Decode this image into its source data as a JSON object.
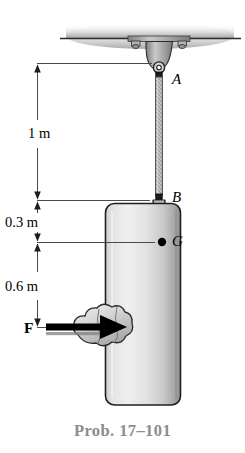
{
  "figure": {
    "caption": "Prob. 17–101",
    "points": {
      "support": "A",
      "attachment": "B",
      "center_of_mass": "G"
    },
    "force": {
      "label": "F",
      "direction": "right",
      "application_point_label": ""
    },
    "dimensions": [
      {
        "label": "1 m",
        "from": "A",
        "to": "B"
      },
      {
        "label": "0.3 m",
        "from": "B",
        "to": "G"
      },
      {
        "label": "0.6 m",
        "from": "G",
        "to": "F"
      }
    ],
    "colors": {
      "line": "#000000",
      "ceiling_shadow": "#b9b9b9",
      "block_light": "#e9e9e9",
      "block_dark": "#9a9a9a",
      "caption": "#8d8d8d",
      "dimension_line": "#555555"
    }
  }
}
